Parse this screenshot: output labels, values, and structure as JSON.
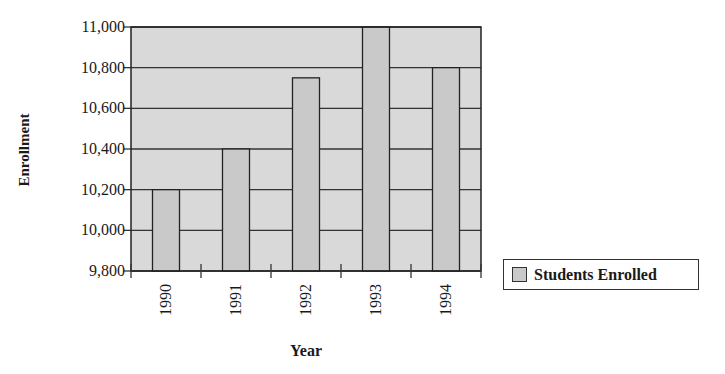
{
  "chart_data": {
    "type": "bar",
    "title": "",
    "xlabel": "Year",
    "ylabel": "Enrollment",
    "categories": [
      "1990",
      "1991",
      "1992",
      "1993",
      "1994"
    ],
    "series": [
      {
        "name": "Students Enrolled",
        "values": [
          10200,
          10400,
          10750,
          11000,
          10800
        ],
        "color": "#c9c9c9"
      }
    ],
    "ylim": [
      9800,
      11000
    ],
    "yticks": [
      9800,
      10000,
      10200,
      10400,
      10600,
      10800,
      11000
    ],
    "ytick_labels": [
      "9,800",
      "10,000",
      "10,200",
      "10,400",
      "10,600",
      "10,800",
      "11,000"
    ],
    "grid": true,
    "legend_position": "right",
    "plot_background": "#d9d9d9"
  },
  "legend": {
    "label": "Students Enrolled"
  }
}
